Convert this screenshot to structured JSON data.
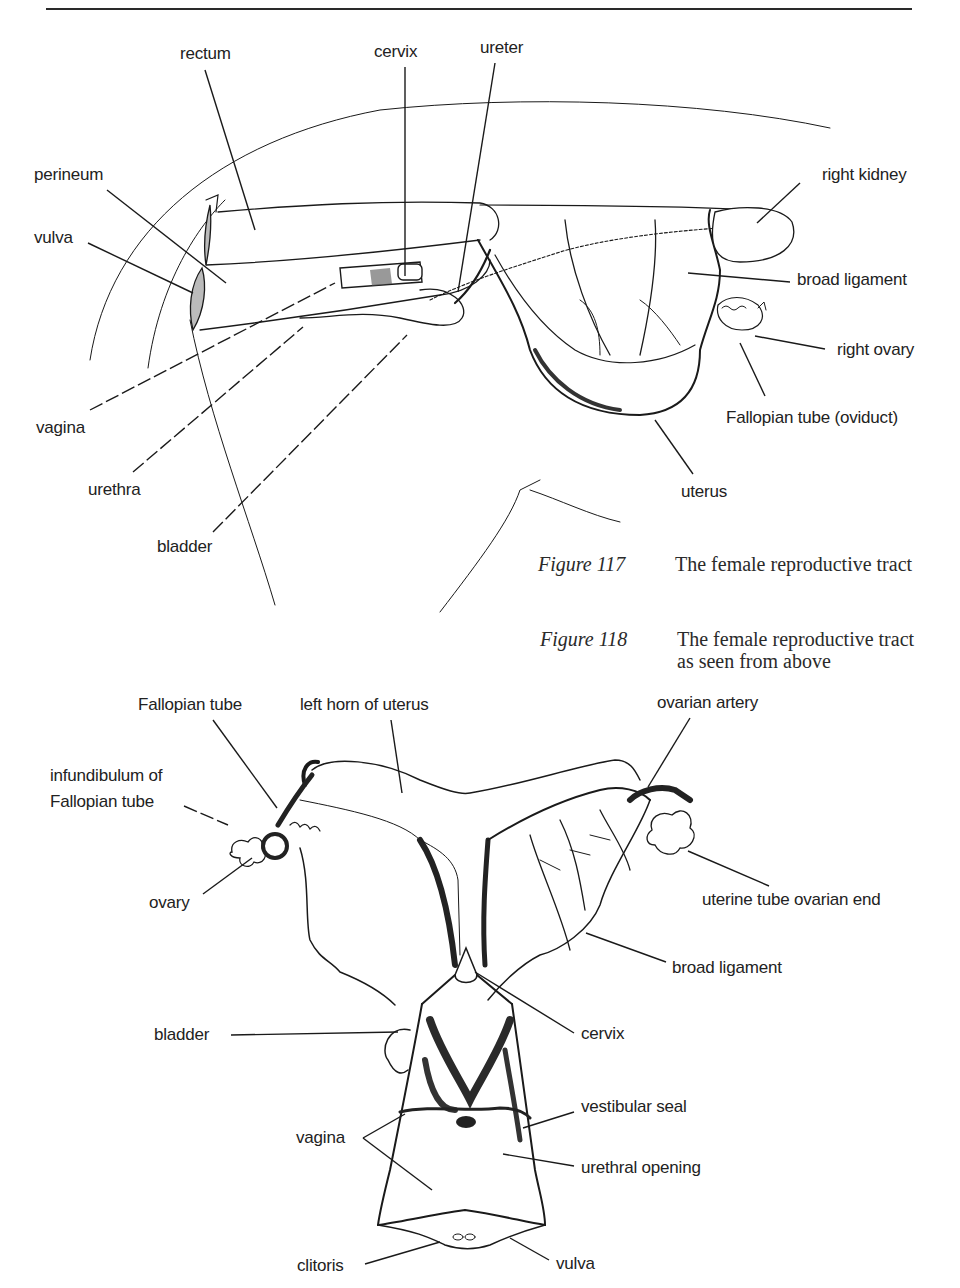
{
  "figure_117": {
    "caption_number": "Figure 117",
    "caption_text": "The female reproductive tract",
    "labels": {
      "rectum": "rectum",
      "cervix": "cervix",
      "ureter": "ureter",
      "perineum": "perineum",
      "vulva": "vulva",
      "right_kidney": "right kidney",
      "broad_ligament": "broad ligament",
      "right_ovary": "right ovary",
      "fallopian_tube": "Fallopian tube (oviduct)",
      "vagina": "vagina",
      "urethra": "urethra",
      "bladder": "bladder",
      "uterus": "uterus"
    }
  },
  "figure_118": {
    "caption_number": "Figure 118",
    "caption_text": "The female reproductive tract as seen from above",
    "labels": {
      "fallopian_tube": "Fallopian tube",
      "left_horn": "left horn of uterus",
      "ovarian_artery": "ovarian artery",
      "infundibulum_line1": "infundibulum of",
      "infundibulum_line2": "Fallopian tube",
      "ovary": "ovary",
      "uterine_tube_end": "uterine tube ovarian end",
      "broad_ligament": "broad ligament",
      "bladder": "bladder",
      "cervix": "cervix",
      "vestibular_seal": "vestibular seal",
      "vagina": "vagina",
      "urethral_opening": "urethral opening",
      "clitoris": "clitoris",
      "vulva": "vulva"
    }
  },
  "colors": {
    "ink": "#1a1a1a",
    "paper": "#ffffff"
  }
}
